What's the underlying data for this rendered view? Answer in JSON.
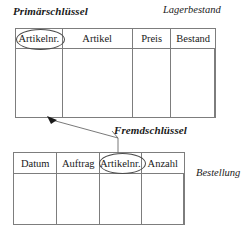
{
  "diagram": {
    "title_primary_key": "Primärschlüssel",
    "title_foreign_key": "Fremdschlüssel",
    "entity_top": "Lagerbestand",
    "entity_bottom": "Bestellung",
    "accent_color": "#7d7d7d",
    "text_color": "#1a1a1a",
    "ellipse_color": "#4a4a4a",
    "tables": [
      {
        "name": "Lagerbestand",
        "columns": [
          "Artikelnr.",
          "Artikel",
          "Preis",
          "Bestand"
        ],
        "key_column": "Artikelnr.",
        "key_type": "Primärschlüssel",
        "rows": []
      },
      {
        "name": "Bestellung",
        "columns": [
          "Datum",
          "Auftrag",
          "Artikelnr.",
          "Anzahl"
        ],
        "key_column": "Artikelnr.",
        "key_type": "Fremdschlüssel",
        "rows": []
      }
    ]
  }
}
